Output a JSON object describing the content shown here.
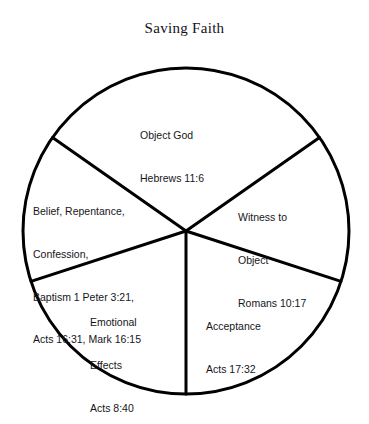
{
  "title": "Saving Faith",
  "diagram": {
    "type": "pie-wheel",
    "shape": "circle-with-five-sectors",
    "center": {
      "x": 186,
      "y": 231
    },
    "radius": 163,
    "stroke_color": "#000000",
    "fill_color": "#ffffff",
    "background_color": "#ffffff",
    "segments": [
      {
        "id": "object-god",
        "name": "Object God",
        "lines": [
          "Object God",
          "Hebrews 11:6"
        ],
        "reference": "Hebrews 11:6",
        "start_angle_deg": 35,
        "end_angle_deg": 145
      },
      {
        "id": "witness-to-object",
        "name": "Witness to Object",
        "lines": [
          "Witness to",
          "Object",
          "Romans 10:17"
        ],
        "reference": "Romans 10:17",
        "start_angle_deg": -18,
        "end_angle_deg": 35
      },
      {
        "id": "acceptance",
        "name": "Acceptance",
        "lines": [
          "Acceptance",
          "Acts 17:32"
        ],
        "reference": "Acts 17:32",
        "start_angle_deg": -90,
        "end_angle_deg": -18
      },
      {
        "id": "emotional-effects",
        "name": "Emotional Effects",
        "lines": [
          "Emotional",
          "Effects",
          "Acts 8:40"
        ],
        "reference": "Acts 8:40",
        "start_angle_deg": -162,
        "end_angle_deg": -90
      },
      {
        "id": "belief-repentance-confession",
        "name": "Belief, Repentance, Confession, Baptism",
        "lines": [
          "Belief, Repentance,",
          "Confession,",
          "Baptism 1 Peter 3:21,",
          "Acts 16:31, Mark 16:15"
        ],
        "reference": "1 Peter 3:21, Acts 16:31, Mark 16:15",
        "start_angle_deg": 145,
        "end_angle_deg": 198
      }
    ]
  }
}
